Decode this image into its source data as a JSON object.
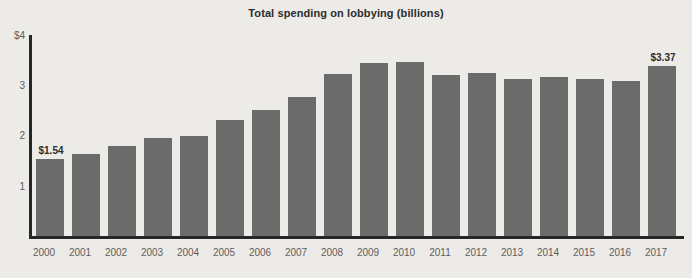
{
  "chart_data": {
    "type": "bar",
    "title": "Total spending on lobbying (billions)",
    "xlabel": "",
    "ylabel": "",
    "ylim": [
      0,
      4
    ],
    "grid": false,
    "legend": "none",
    "y_ticks": [
      "$4",
      "3",
      "2",
      "1"
    ],
    "y_tick_values": [
      4,
      3,
      2,
      1
    ],
    "categories": [
      "2000",
      "2001",
      "2002",
      "2003",
      "2004",
      "2005",
      "2006",
      "2007",
      "2008",
      "2009",
      "2010",
      "2011",
      "2012",
      "2013",
      "2014",
      "2015",
      "2016",
      "2017"
    ],
    "values": [
      1.54,
      1.64,
      1.78,
      1.95,
      1.99,
      2.3,
      2.5,
      2.77,
      3.22,
      3.43,
      3.45,
      3.2,
      3.24,
      3.12,
      3.16,
      3.12,
      3.08,
      3.37
    ],
    "annotations": [
      {
        "category": "2000",
        "label": "$1.54"
      },
      {
        "category": "2017",
        "label": "$3.37"
      }
    ],
    "bar_color": "#6b6b6b",
    "background_color": "#edebe7",
    "axis_color": "#262626",
    "text_color": "#2d2d2d",
    "tick_label_color": "#5d5d5d"
  }
}
